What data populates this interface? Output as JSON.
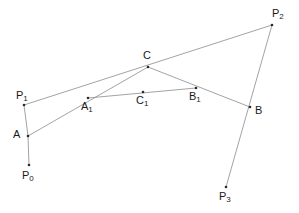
{
  "figure": {
    "background_color": "#ffffff",
    "line_color": "#8c8c8c",
    "dot_color": "#2b2b2b",
    "label_color": "#1a1a1a",
    "width": 299,
    "height": 213
  },
  "points": [
    {
      "id": "P0",
      "base": "P",
      "sub": "0",
      "x": 29,
      "y": 165,
      "label_x": 22,
      "label_y": 170
    },
    {
      "id": "P1",
      "base": "P",
      "sub": "1",
      "x": 24,
      "y": 105,
      "label_x": 16,
      "label_y": 90
    },
    {
      "id": "P2",
      "base": "P",
      "sub": "2",
      "x": 272,
      "y": 25,
      "label_x": 272,
      "label_y": 8
    },
    {
      "id": "P3",
      "base": "P",
      "sub": "3",
      "x": 226,
      "y": 187,
      "label_x": 219,
      "label_y": 191
    },
    {
      "id": "A",
      "base": "A",
      "sub": "",
      "x": 28,
      "y": 136,
      "label_x": 13,
      "label_y": 129
    },
    {
      "id": "B",
      "base": "B",
      "sub": "",
      "x": 250,
      "y": 107,
      "label_x": 255,
      "label_y": 105
    },
    {
      "id": "C",
      "base": "C",
      "sub": "",
      "x": 148,
      "y": 67,
      "label_x": 143,
      "label_y": 50
    },
    {
      "id": "A1",
      "base": "A",
      "sub": "1",
      "x": 88,
      "y": 98,
      "label_x": 81,
      "label_y": 101
    },
    {
      "id": "B1",
      "base": "B",
      "sub": "1",
      "x": 196,
      "y": 88,
      "label_x": 189,
      "label_y": 91
    },
    {
      "id": "C1",
      "base": "C",
      "sub": "1",
      "x": 143,
      "y": 92,
      "label_x": 136,
      "label_y": 95
    }
  ],
  "segments": [
    {
      "id": "P0-A",
      "from": "P0",
      "to": "A",
      "x1": 29,
      "y1": 165,
      "x2": 28,
      "y2": 136
    },
    {
      "id": "A-P1",
      "from": "A",
      "to": "P1",
      "x1": 28,
      "y1": 136,
      "x2": 24,
      "y2": 105
    },
    {
      "id": "P1-P2",
      "from": "P1",
      "to": "P2",
      "x1": 24,
      "y1": 105,
      "x2": 272,
      "y2": 25
    },
    {
      "id": "P2-P3",
      "from": "P2",
      "to": "P3",
      "x1": 272,
      "y1": 25,
      "x2": 226,
      "y2": 187
    },
    {
      "id": "A-C",
      "from": "A",
      "to": "C",
      "x1": 28,
      "y1": 136,
      "x2": 148,
      "y2": 67
    },
    {
      "id": "C-B",
      "from": "C",
      "to": "B",
      "x1": 148,
      "y1": 67,
      "x2": 250,
      "y2": 107
    },
    {
      "id": "A1-B1",
      "from": "A1",
      "to": "B1",
      "x1": 88,
      "y1": 98,
      "x2": 196,
      "y2": 88
    }
  ]
}
